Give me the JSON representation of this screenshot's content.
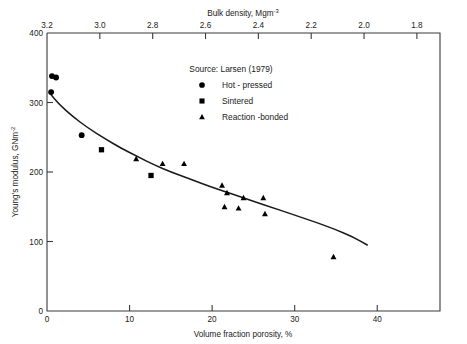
{
  "chart_data": {
    "type": "scatter",
    "title": "",
    "xlabel": "Volume fraction porosity, %",
    "ylabel": "Young's modulus, GNm",
    "ylabel_exponent": "-2",
    "top_axis_label": "Bulk density, Mgm",
    "top_axis_exponent": "-3",
    "xlim": [
      0,
      47.6
    ],
    "ylim": [
      0,
      400
    ],
    "xticks": [
      0,
      10,
      20,
      30,
      40
    ],
    "xticklabels": [
      "0",
      "10",
      "20",
      "30",
      "40"
    ],
    "yticks": [
      0,
      100,
      200,
      300,
      400
    ],
    "yticklabels": [
      "0",
      "100",
      "200",
      "300",
      "400"
    ],
    "top_ticks_porosity": [
      0,
      6.4,
      12.8,
      19.2,
      25.6,
      32.0,
      38.4,
      44.8
    ],
    "top_ticklabels": [
      "3.2",
      "3.0",
      "2.8",
      "2.6",
      "2.4",
      "2.2",
      "2.0",
      "1.8"
    ],
    "grid": false,
    "legend_position": "upper-center",
    "source_note": "Source:  Larsen  (1979)",
    "series": [
      {
        "name": "Hot - pressed",
        "marker": "circle",
        "points": [
          {
            "x": 0.6,
            "y": 338
          },
          {
            "x": 1.1,
            "y": 336
          },
          {
            "x": 0.5,
            "y": 315
          },
          {
            "x": 4.2,
            "y": 253
          }
        ]
      },
      {
        "name": "Sintered",
        "marker": "square",
        "points": [
          {
            "x": 6.6,
            "y": 232
          },
          {
            "x": 12.6,
            "y": 195
          }
        ]
      },
      {
        "name": "Reaction - bonded",
        "marker": "triangle",
        "points": [
          {
            "x": 10.8,
            "y": 219
          },
          {
            "x": 14.0,
            "y": 212
          },
          {
            "x": 16.6,
            "y": 212
          },
          {
            "x": 21.2,
            "y": 181
          },
          {
            "x": 21.8,
            "y": 170
          },
          {
            "x": 23.8,
            "y": 163
          },
          {
            "x": 26.2,
            "y": 163
          },
          {
            "x": 21.5,
            "y": 150
          },
          {
            "x": 23.2,
            "y": 148
          },
          {
            "x": 26.4,
            "y": 140
          },
          {
            "x": 34.7,
            "y": 78
          }
        ]
      }
    ],
    "fit_curve": {
      "label": "",
      "points": [
        {
          "x": 0.3,
          "y": 314
        },
        {
          "x": 1.5,
          "y": 297
        },
        {
          "x": 3.0,
          "y": 281
        },
        {
          "x": 5.0,
          "y": 263
        },
        {
          "x": 7.0,
          "y": 248
        },
        {
          "x": 9.0,
          "y": 234
        },
        {
          "x": 11.0,
          "y": 222
        },
        {
          "x": 13.0,
          "y": 210
        },
        {
          "x": 15.0,
          "y": 200
        },
        {
          "x": 17.5,
          "y": 189
        },
        {
          "x": 20.0,
          "y": 178
        },
        {
          "x": 22.5,
          "y": 168
        },
        {
          "x": 25.0,
          "y": 158
        },
        {
          "x": 27.5,
          "y": 148
        },
        {
          "x": 30.0,
          "y": 138
        },
        {
          "x": 32.5,
          "y": 128
        },
        {
          "x": 35.0,
          "y": 117
        },
        {
          "x": 37.0,
          "y": 107
        },
        {
          "x": 38.8,
          "y": 95
        }
      ]
    }
  },
  "legend": {
    "source": "Source:  Larsen  (1979)",
    "entries": [
      {
        "marker": "circle",
        "label": "Hot - pressed"
      },
      {
        "marker": "square",
        "label": "Sintered"
      },
      {
        "marker": "triangle",
        "label": "Reaction -bonded"
      }
    ]
  }
}
